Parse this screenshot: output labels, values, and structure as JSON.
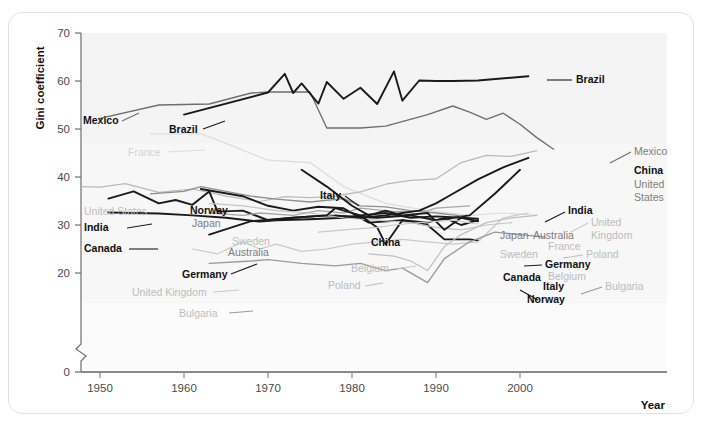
{
  "chart_data": {
    "type": "line",
    "title": "",
    "xlabel": "Year",
    "ylabel": "Gini coefficient",
    "xlim": [
      1947,
      2006
    ],
    "ylim": [
      0,
      70
    ],
    "y_axis_break": true,
    "y_break_between": [
      0,
      20
    ],
    "xticks": [
      1950,
      1960,
      1970,
      1980,
      1990,
      2000
    ],
    "yticks": [
      0,
      20,
      30,
      40,
      50,
      60,
      70
    ],
    "grid": false,
    "legend": "inline-labels",
    "series": [
      {
        "name": "Mexico",
        "color": "#6e6e6e",
        "emphasis": "mid",
        "x": [
          1950,
          1957,
          1963,
          1968,
          1970,
          1975,
          1977,
          1981,
          1984,
          1989,
          1992,
          1994,
          1996,
          1998,
          2000,
          2002,
          2004
        ],
        "values": [
          52.2,
          55.0,
          55.2,
          57.5,
          57.7,
          57.7,
          50.2,
          50.2,
          50.6,
          53.0,
          54.8,
          53.5,
          52.0,
          53.3,
          51.0,
          48.2,
          45.8
        ]
      },
      {
        "name": "Brazil",
        "color": "#1a1a1a",
        "emphasis": "dark",
        "x": [
          1960,
          1970,
          1972,
          1973,
          1974,
          1976,
          1977,
          1979,
          1981,
          1983,
          1985,
          1986,
          1988,
          1990,
          1992,
          1995,
          2001
        ],
        "values": [
          53.0,
          57.6,
          61.5,
          57.5,
          59.5,
          55.3,
          59.8,
          56.3,
          58.6,
          55.2,
          62.0,
          55.9,
          60.1,
          60.0,
          60.0,
          60.1,
          61.0
        ]
      },
      {
        "name": "France",
        "color": "#dcdcdc",
        "emphasis": "light",
        "x": [
          1956,
          1962,
          1965,
          1970,
          1975,
          1979,
          1984,
          1989,
          1994,
          1998,
          2002
        ],
        "values": [
          49.0,
          49.0,
          47.0,
          43.5,
          43.0,
          38.0,
          34.5,
          33.0,
          32.0,
          32.5,
          32.0
        ]
      },
      {
        "name": "United States",
        "color": "#b9b9b9",
        "emphasis": "light",
        "x": [
          1947,
          1950,
          1953,
          1957,
          1961,
          1965,
          1969,
          1972,
          1975,
          1978,
          1981,
          1984,
          1987,
          1990,
          1993,
          1996,
          1999,
          2002
        ],
        "values": [
          38.0,
          37.9,
          38.6,
          36.8,
          37.5,
          36.0,
          34.9,
          35.9,
          35.7,
          36.0,
          36.9,
          38.5,
          39.3,
          39.6,
          43.0,
          44.5,
          44.3,
          45.5
        ]
      },
      {
        "name": "India",
        "color": "#1a1a1a",
        "emphasis": "dark",
        "x": [
          1951,
          1954,
          1957,
          1959,
          1961,
          1963,
          1964,
          1967,
          1970,
          1973,
          1977,
          1983,
          1987,
          1990,
          1994,
          1997,
          2000
        ],
        "values": [
          35.5,
          37.0,
          34.5,
          35.2,
          34.2,
          37.0,
          32.8,
          33.0,
          31.0,
          31.5,
          32.0,
          31.5,
          32.0,
          31.0,
          32.0,
          36.5,
          41.5
        ]
      },
      {
        "name": "Canada",
        "color": "#1a1a1a",
        "emphasis": "dark",
        "x": [
          1951,
          1957,
          1961,
          1965,
          1969,
          1971,
          1975,
          1979,
          1981,
          1984,
          1987,
          1990,
          1993,
          1995
        ],
        "values": [
          32.6,
          32.4,
          32.0,
          31.5,
          30.7,
          31.0,
          31.2,
          31.5,
          32.0,
          32.5,
          31.5,
          31.8,
          31.5,
          31.3
        ]
      },
      {
        "name": "Japan",
        "color": "#8f8f8f",
        "emphasis": "mid",
        "x": [
          1956,
          1960,
          1962,
          1965,
          1968,
          1971,
          1975,
          1979,
          1981,
          1984,
          1987,
          1990,
          1993
        ],
        "values": [
          36.5,
          37.0,
          38.0,
          37.0,
          36.0,
          35.4,
          34.8,
          35.5,
          34.0,
          33.8,
          33.0,
          32.5,
          31.9
        ]
      },
      {
        "name": "Norway",
        "color": "#1a1a1a",
        "emphasis": "dark",
        "x": [
          1962,
          1967,
          1970,
          1973,
          1976,
          1979,
          1982,
          1986,
          1989,
          1991,
          1994,
          1995
        ],
        "values": [
          37.5,
          36.0,
          34.0,
          33.0,
          33.8,
          33.5,
          30.5,
          31.0,
          30.0,
          27.0,
          27.0,
          26.8
        ]
      },
      {
        "name": "Sweden",
        "color": "#c4c4c4",
        "emphasis": "light",
        "x": [
          1963,
          1967,
          1971,
          1975,
          1979,
          1983,
          1987,
          1990,
          1993,
          1996,
          1999
        ],
        "values": [
          34.5,
          34.0,
          33.0,
          32.5,
          31.5,
          31.0,
          30.5,
          29.5,
          29.0,
          30.0,
          30.5
        ]
      },
      {
        "name": "Australia",
        "color": "#a8a8a8",
        "emphasis": "mid",
        "x": [
          1963,
          1967,
          1969,
          1973,
          1976,
          1979,
          1981,
          1985,
          1989,
          1990,
          1994
        ],
        "values": [
          32.5,
          32.0,
          32.5,
          32.0,
          33.0,
          32.5,
          33.5,
          32.8,
          33.0,
          33.5,
          34.0
        ]
      },
      {
        "name": "Germany",
        "color": "#1a1a1a",
        "emphasis": "dark",
        "x": [
          1963,
          1968,
          1973,
          1977,
          1978,
          1981,
          1983,
          1984,
          1986,
          1989,
          1991,
          1993,
          1995
        ],
        "values": [
          28.0,
          30.8,
          31.5,
          32.0,
          33.5,
          32.0,
          29.5,
          26.0,
          31.0,
          30.5,
          31.5,
          30.0,
          31.0
        ]
      },
      {
        "name": "Italy",
        "color": "#1a1a1a",
        "emphasis": "dark",
        "x": [
          1974,
          1977,
          1980,
          1982,
          1984,
          1986,
          1989,
          1991,
          1993,
          1995
        ],
        "values": [
          41.5,
          38.0,
          34.0,
          32.0,
          33.0,
          32.0,
          32.5,
          29.0,
          31.5,
          30.8
        ]
      },
      {
        "name": "China",
        "color": "#1a1a1a",
        "emphasis": "dark",
        "x": [
          1978,
          1981,
          1984,
          1986,
          1988,
          1990,
          1992,
          1995,
          1998,
          2001
        ],
        "values": [
          32.0,
          31.5,
          32.0,
          32.5,
          33.0,
          34.5,
          36.5,
          39.5,
          42.0,
          44.0
        ]
      },
      {
        "name": "Belgium",
        "color": "#c9c9c9",
        "emphasis": "light",
        "x": [
          1976,
          1979,
          1983,
          1985,
          1988,
          1992,
          1995
        ],
        "values": [
          28.5,
          29.0,
          29.5,
          30.0,
          30.5,
          31.0,
          30.2
        ]
      },
      {
        "name": "United Kingdom",
        "color": "#c9c9c9",
        "emphasis": "light",
        "x": [
          1961,
          1964,
          1967,
          1969,
          1971,
          1974,
          1977,
          1980,
          1983,
          1986,
          1989,
          1992,
          1995,
          1998,
          2001
        ],
        "values": [
          25.0,
          24.0,
          26.5,
          25.0,
          26.0,
          24.5,
          25.0,
          26.0,
          26.5,
          27.0,
          26.5,
          26.0,
          26.5,
          31.5,
          32.5
        ]
      },
      {
        "name": "Poland",
        "color": "#bfbfbf",
        "emphasis": "light",
        "x": [
          1982,
          1985,
          1987,
          1989,
          1991,
          1993,
          1996,
          1999,
          2002
        ],
        "values": [
          24.0,
          23.5,
          22.5,
          20.5,
          25.5,
          28.0,
          30.5,
          31.5,
          32.0
        ]
      },
      {
        "name": "Bulgaria",
        "color": "#9a9a9a",
        "emphasis": "mid",
        "x": [
          1963,
          1968,
          1970,
          1974,
          1978,
          1981,
          1984,
          1986,
          1989,
          1991,
          1994,
          1997,
          2000,
          2003
        ],
        "values": [
          22.0,
          22.5,
          22.8,
          22.0,
          21.5,
          22.0,
          20.5,
          21.0,
          18.0,
          23.0,
          26.5,
          28.5,
          28.0,
          27.5
        ]
      }
    ],
    "annotations": [
      {
        "text": "Mexico",
        "tone": "b",
        "x": 83,
        "y": 124,
        "anchor": "start"
      },
      {
        "text": "Brazil",
        "tone": "b",
        "x": 169,
        "y": 133,
        "anchor": "start"
      },
      {
        "text": "France",
        "tone": "xl",
        "x": 128,
        "y": 156,
        "anchor": "start"
      },
      {
        "text": "United States",
        "tone": "l",
        "x": 84,
        "y": 215,
        "anchor": "start"
      },
      {
        "text": "India",
        "tone": "b",
        "x": 84,
        "y": 231,
        "anchor": "start"
      },
      {
        "text": "Canada",
        "tone": "b",
        "x": 84,
        "y": 252,
        "anchor": "start"
      },
      {
        "text": "Norway",
        "tone": "b",
        "x": 190,
        "y": 214,
        "anchor": "start"
      },
      {
        "text": "Japan",
        "tone": "m",
        "x": 192,
        "y": 227,
        "anchor": "start"
      },
      {
        "text": "Sweden",
        "tone": "l",
        "x": 232,
        "y": 245,
        "anchor": "start"
      },
      {
        "text": "Australia",
        "tone": "m",
        "x": 228,
        "y": 256,
        "anchor": "start"
      },
      {
        "text": "Germany",
        "tone": "b",
        "x": 182,
        "y": 278,
        "anchor": "start"
      },
      {
        "text": "United Kingdom",
        "tone": "l",
        "x": 132,
        "y": 296,
        "anchor": "start"
      },
      {
        "text": "Bulgaria",
        "tone": "l",
        "x": 179,
        "y": 317,
        "anchor": "start"
      },
      {
        "text": "Italy",
        "tone": "b",
        "x": 320,
        "y": 199,
        "anchor": "start"
      },
      {
        "text": "China",
        "tone": "b",
        "x": 371,
        "y": 246,
        "anchor": "start"
      },
      {
        "text": "Belgium",
        "tone": "l",
        "x": 351,
        "y": 272,
        "anchor": "start"
      },
      {
        "text": "Poland",
        "tone": "l",
        "x": 328,
        "y": 289,
        "anchor": "start"
      },
      {
        "text": "Brazil",
        "tone": "b",
        "x": 576,
        "y": 83,
        "anchor": "start"
      },
      {
        "text": "Mexico",
        "tone": "m",
        "x": 634,
        "y": 155,
        "anchor": "start"
      },
      {
        "text": "China",
        "tone": "b",
        "x": 634,
        "y": 174,
        "anchor": "start"
      },
      {
        "text": "United",
        "tone": "m",
        "x": 634,
        "y": 188,
        "anchor": "start"
      },
      {
        "text": "States",
        "tone": "m",
        "x": 634,
        "y": 201,
        "anchor": "start"
      },
      {
        "text": "India",
        "tone": "b",
        "x": 568,
        "y": 214,
        "anchor": "start"
      },
      {
        "text": "Japan",
        "tone": "m",
        "x": 500,
        "y": 239,
        "anchor": "start"
      },
      {
        "text": "Australia",
        "tone": "m",
        "x": 533,
        "y": 239,
        "anchor": "start"
      },
      {
        "text": "United",
        "tone": "l",
        "x": 591,
        "y": 226,
        "anchor": "start"
      },
      {
        "text": "Kingdom",
        "tone": "l",
        "x": 591,
        "y": 239,
        "anchor": "start"
      },
      {
        "text": "France",
        "tone": "l",
        "x": 548,
        "y": 250,
        "anchor": "start"
      },
      {
        "text": "Sweden",
        "tone": "l",
        "x": 500,
        "y": 258,
        "anchor": "start"
      },
      {
        "text": "Poland",
        "tone": "l",
        "x": 586,
        "y": 258,
        "anchor": "start"
      },
      {
        "text": "Germany",
        "tone": "b",
        "x": 545,
        "y": 268,
        "anchor": "start"
      },
      {
        "text": "Belgium",
        "tone": "l",
        "x": 548,
        "y": 280,
        "anchor": "start"
      },
      {
        "text": "Canada",
        "tone": "b",
        "x": 503,
        "y": 281,
        "anchor": "start"
      },
      {
        "text": "Italy",
        "tone": "b",
        "x": 543,
        "y": 290,
        "anchor": "start"
      },
      {
        "text": "Bulgaria",
        "tone": "l",
        "x": 605,
        "y": 290,
        "anchor": "start"
      },
      {
        "text": "Norway",
        "tone": "b",
        "x": 527,
        "y": 303,
        "anchor": "start"
      }
    ]
  },
  "axes": {
    "ylabel": "Gini coefficient",
    "xlabel": "Year",
    "yticklabels": [
      "70",
      "60",
      "50",
      "40",
      "30",
      "20",
      "0"
    ],
    "xticklabels": [
      "1950",
      "1960",
      "1970",
      "1980",
      "1990",
      "2000"
    ]
  }
}
